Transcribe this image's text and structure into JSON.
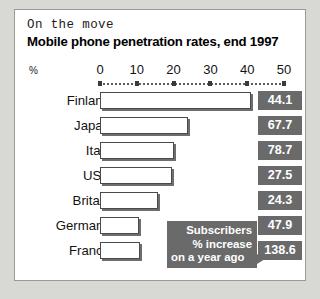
{
  "kicker": "On the move",
  "headline": "Mobile phone penetration rates, end 1997",
  "axis": {
    "unit_label": "%",
    "ticks": [
      "0",
      "10",
      "20",
      "30",
      "40",
      "50"
    ]
  },
  "callout": {
    "line_1": "Subscribers",
    "line_2": "% increase",
    "line_3": "on a year ago"
  },
  "chart_data": {
    "type": "bar",
    "title": "Mobile phone penetration rates, end 1997",
    "subtitle": "On the move",
    "orientation": "horizontal",
    "xlabel": "%",
    "ylabel": "",
    "xlim": [
      0,
      50
    ],
    "xticks": [
      0,
      10,
      20,
      30,
      40,
      50
    ],
    "grid": false,
    "legend": "none",
    "categories": [
      "Finland",
      "Japan",
      "Italy",
      "USA",
      "Britain",
      "Germany",
      "France"
    ],
    "series": [
      {
        "name": "Penetration rate, end 1997 (%)",
        "values": [
          41.0,
          24.0,
          20.0,
          19.7,
          15.7,
          10.7,
          10.9
        ]
      },
      {
        "name": "Subscribers % increase on a year ago",
        "values": [
          44.1,
          67.7,
          78.7,
          27.5,
          24.3,
          47.9,
          138.6
        ],
        "display": "badge"
      }
    ],
    "annotations": [
      "Subscribers % increase on a year ago"
    ]
  },
  "colors": {
    "badge": "#6a6a6a",
    "bar_fill": "#ffffff",
    "bar_border": "#4a4a4a",
    "panel": "#ffffff",
    "page": "#d8d8d4"
  }
}
